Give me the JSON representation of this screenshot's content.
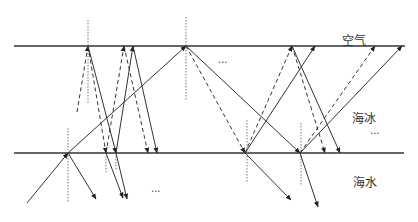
{
  "labels": {
    "air": "空气",
    "sea_ice": "海冰",
    "sea_water": "海水",
    "ellipsis": "..."
  },
  "colors": {
    "line": "#333333",
    "normal": "#777777"
  },
  "boundaries": [
    {
      "name": "air-ice-boundary",
      "x1": 14,
      "y1": 46,
      "x2": 405,
      "y2": 46
    },
    {
      "name": "ice-water-boundary",
      "x1": 14,
      "y1": 153,
      "x2": 404,
      "y2": 153
    }
  ],
  "normals": [
    {
      "x": 88,
      "y1": 20,
      "y2": 103
    },
    {
      "x": 186,
      "y1": 17,
      "y2": 100
    },
    {
      "x": 68,
      "y1": 128,
      "y2": 202
    },
    {
      "x": 106,
      "y1": 150,
      "y2": 172
    },
    {
      "x": 116,
      "y1": 150,
      "y2": 170
    },
    {
      "x": 247,
      "y1": 120,
      "y2": 183
    },
    {
      "x": 301,
      "y1": 123,
      "y2": 186
    }
  ],
  "rays": [
    {
      "x1": 27,
      "y1": 203,
      "x2": 68,
      "y2": 153,
      "style": "solid",
      "arrow": true
    },
    {
      "x1": 68,
      "y1": 153,
      "x2": 186,
      "y2": 46,
      "style": "solid",
      "arrow": true
    },
    {
      "x1": 68,
      "y1": 153,
      "x2": 96,
      "y2": 199,
      "style": "solid",
      "arrow": true
    },
    {
      "x1": 77,
      "y1": 112,
      "x2": 88,
      "y2": 46,
      "style": "dashed",
      "arrow": true
    },
    {
      "x1": 88,
      "y1": 46,
      "x2": 106,
      "y2": 153,
      "style": "dashed",
      "arrow": true
    },
    {
      "x1": 88,
      "y1": 46,
      "x2": 116,
      "y2": 153,
      "style": "solid",
      "arrow": true
    },
    {
      "x1": 106,
      "y1": 153,
      "x2": 124,
      "y2": 46,
      "style": "dashed",
      "arrow": true
    },
    {
      "x1": 116,
      "y1": 153,
      "x2": 133,
      "y2": 46,
      "style": "solid",
      "arrow": true
    },
    {
      "x1": 124,
      "y1": 46,
      "x2": 148,
      "y2": 153,
      "style": "dashed",
      "arrow": true
    },
    {
      "x1": 133,
      "y1": 46,
      "x2": 157,
      "y2": 153,
      "style": "solid",
      "arrow": true
    },
    {
      "x1": 106,
      "y1": 153,
      "x2": 123,
      "y2": 198,
      "style": "solid",
      "arrow": true
    },
    {
      "x1": 116,
      "y1": 153,
      "x2": 127,
      "y2": 199,
      "style": "solid",
      "arrow": true
    },
    {
      "x1": 186,
      "y1": 46,
      "x2": 245,
      "y2": 153,
      "style": "dashed",
      "arrow": true
    },
    {
      "x1": 186,
      "y1": 46,
      "x2": 300,
      "y2": 153,
      "style": "solid",
      "arrow": true
    },
    {
      "x1": 245,
      "y1": 153,
      "x2": 292,
      "y2": 46,
      "style": "dashed",
      "arrow": true
    },
    {
      "x1": 245,
      "y1": 153,
      "x2": 315,
      "y2": 46,
      "style": "solid",
      "arrow": true
    },
    {
      "x1": 245,
      "y1": 153,
      "x2": 291,
      "y2": 200,
      "style": "solid",
      "arrow": true
    },
    {
      "x1": 292,
      "y1": 46,
      "x2": 325,
      "y2": 153,
      "style": "dashed",
      "arrow": true
    },
    {
      "x1": 292,
      "y1": 46,
      "x2": 340,
      "y2": 153,
      "style": "solid",
      "arrow": true
    },
    {
      "x1": 300,
      "y1": 153,
      "x2": 375,
      "y2": 46,
      "style": "dashed",
      "arrow": true
    },
    {
      "x1": 300,
      "y1": 153,
      "x2": 402,
      "y2": 46,
      "style": "solid",
      "arrow": true
    },
    {
      "x1": 300,
      "y1": 153,
      "x2": 318,
      "y2": 207,
      "style": "solid",
      "arrow": true
    }
  ],
  "text_positions": {
    "air": {
      "x": 342,
      "y": 45
    },
    "sea_ice": {
      "x": 352,
      "y": 123
    },
    "sea_water": {
      "x": 353,
      "y": 187
    },
    "ellipsis": [
      {
        "x": 218,
        "y": 63
      },
      {
        "x": 370,
        "y": 134
      },
      {
        "x": 151,
        "y": 192
      }
    ]
  }
}
